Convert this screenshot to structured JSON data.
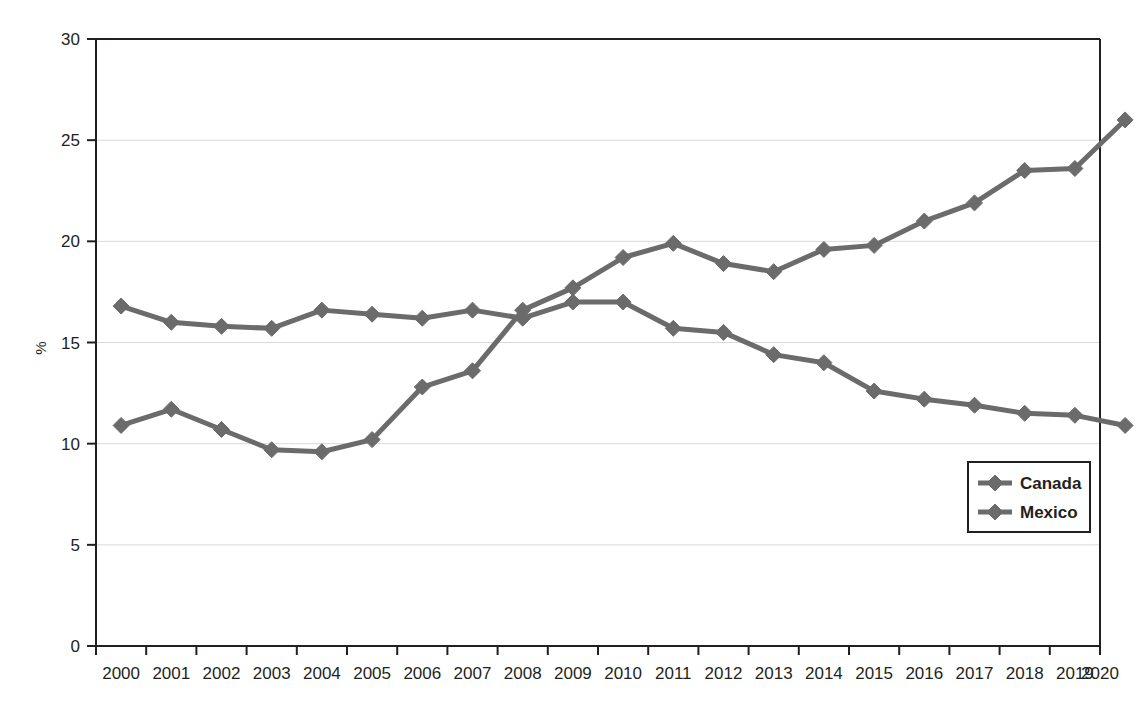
{
  "chart_data": {
    "type": "line",
    "title": "",
    "subtitle": "",
    "xlabel": "",
    "ylabel": "%",
    "x": [
      2000,
      2001,
      2002,
      2003,
      2004,
      2005,
      2006,
      2007,
      2008,
      2009,
      2010,
      2011,
      2012,
      2013,
      2014,
      2015,
      2016,
      2017,
      2018,
      2019,
      2020
    ],
    "xtick_labels": [
      "2000",
      "2001",
      "2002",
      "2003",
      "2004",
      "2005",
      "2006",
      "2007",
      "2008",
      "2009",
      "2010",
      "2011",
      "2012",
      "2013",
      "2014",
      "2015",
      "2016",
      "2017",
      "2018",
      "2019",
      "2020"
    ],
    "ytick_labels": [
      "0",
      "5",
      "10",
      "15",
      "20",
      "25",
      "30"
    ],
    "yticks": [
      0,
      5,
      10,
      15,
      20,
      25,
      30
    ],
    "ylim": [
      0,
      30
    ],
    "xlim": [
      2000,
      2020
    ],
    "grid": "horizontal",
    "legend_position": "center-right",
    "marker": "diamond",
    "series": [
      {
        "name": "Canada",
        "color": "#6b6b6b",
        "values": [
          16.8,
          16.0,
          15.8,
          15.7,
          16.6,
          16.4,
          16.2,
          16.6,
          16.2,
          17.0,
          17.0,
          15.7,
          15.5,
          14.4,
          14.0,
          12.6,
          12.2,
          11.9,
          11.5,
          11.4,
          10.9
        ]
      },
      {
        "name": "Mexico",
        "color": "#6b6b6b",
        "values": [
          10.9,
          11.7,
          10.7,
          9.7,
          9.6,
          10.2,
          12.8,
          13.6,
          16.6,
          17.7,
          19.2,
          19.9,
          18.9,
          18.5,
          19.6,
          19.8,
          21.0,
          21.9,
          23.5,
          23.6,
          26.0
        ]
      }
    ]
  },
  "legend": {
    "entries": [
      {
        "label": "Canada"
      },
      {
        "label": "Mexico"
      }
    ]
  },
  "axes": {
    "y_axis_title": "%"
  }
}
